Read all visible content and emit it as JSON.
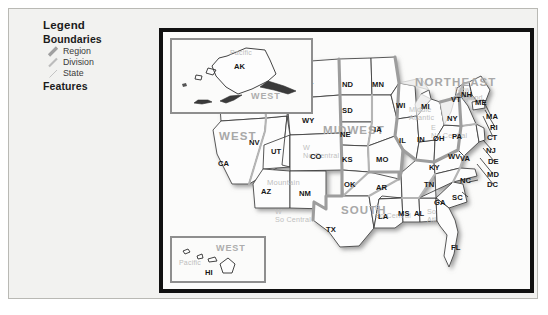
{
  "legend": {
    "title": "Legend",
    "boundaries_heading": "Boundaries",
    "features_heading": "Features",
    "items": [
      {
        "label": "Region",
        "swatch": "region-boundary-swatch",
        "color": "#a0a0a0",
        "width": 3.2
      },
      {
        "label": "Division",
        "swatch": "division-boundary-swatch",
        "color": "#bcbcbc",
        "width": 2.2
      },
      {
        "label": "State",
        "swatch": "state-boundary-swatch",
        "color": "#c8c8c8",
        "width": 1.0
      }
    ]
  },
  "map": {
    "title": "United States Census Regions and Divisions",
    "land_color": "#fdfdfd",
    "state_line_color": "#3a3a3a",
    "division_line_color": "#b5b5b5",
    "region_line_color": "#9d9d9d",
    "frame_color": "#111111",
    "regions": [
      {
        "name": "WEST",
        "x": 84,
        "y": 105
      },
      {
        "name": "MIDWEST",
        "x": 190,
        "y": 98
      },
      {
        "name": "SOUTH",
        "x": 205,
        "y": 178
      },
      {
        "name": "NORTHEAST",
        "x": 283,
        "y": 52
      }
    ],
    "divisions": [
      {
        "name": "Pacific",
        "x": 74,
        "y": 62
      },
      {
        "name": "Mountain",
        "x": 120,
        "y": 149
      },
      {
        "name": "W No Central",
        "line1": "W",
        "line2": "No Central",
        "x": 148,
        "y": 118
      },
      {
        "name": "E No Central",
        "line1": "E",
        "line2": "No Central",
        "x": 236,
        "y": 100
      },
      {
        "name": "W So Central",
        "line1": "W",
        "line2": "So Central",
        "x": 126,
        "y": 182
      },
      {
        "name": "E So Central",
        "line1": "E",
        "line2": "So Central",
        "x": 220,
        "y": 180
      },
      {
        "name": "So Atl",
        "line1": "So",
        "line2": "Atl",
        "x": 265,
        "y": 185
      },
      {
        "name": "New England",
        "line1": "New",
        "line2": "England",
        "x": 300,
        "y": 63
      },
      {
        "name": "Middle Atlantic",
        "line1": "Middle",
        "line2": "Atlantic",
        "x": 255,
        "y": 82
      }
    ],
    "states": [
      {
        "code": "WA",
        "x": 81,
        "y": 46
      },
      {
        "code": "OR",
        "x": 69,
        "y": 73
      },
      {
        "code": "CA",
        "x": 62,
        "y": 131
      },
      {
        "code": "NV",
        "x": 93,
        "y": 110
      },
      {
        "code": "ID",
        "x": 113,
        "y": 75
      },
      {
        "code": "MT",
        "x": 146,
        "y": 53
      },
      {
        "code": "WY",
        "x": 146,
        "y": 88
      },
      {
        "code": "UT",
        "x": 115,
        "y": 119
      },
      {
        "code": "CO",
        "x": 154,
        "y": 124
      },
      {
        "code": "AZ",
        "x": 105,
        "y": 159
      },
      {
        "code": "NM",
        "x": 143,
        "y": 161
      },
      {
        "code": "ND",
        "x": 186,
        "y": 52
      },
      {
        "code": "SD",
        "x": 186,
        "y": 78
      },
      {
        "code": "NE",
        "x": 184,
        "y": 102
      },
      {
        "code": "KS",
        "x": 186,
        "y": 127
      },
      {
        "code": "OK",
        "x": 188,
        "y": 152
      },
      {
        "code": "TX",
        "x": 170,
        "y": 197
      },
      {
        "code": "MN",
        "x": 216,
        "y": 52
      },
      {
        "code": "IA",
        "x": 218,
        "y": 97
      },
      {
        "code": "MO",
        "x": 220,
        "y": 127
      },
      {
        "code": "AR",
        "x": 220,
        "y": 155
      },
      {
        "code": "LA",
        "x": 222,
        "y": 184
      },
      {
        "code": "WI",
        "x": 240,
        "y": 73
      },
      {
        "code": "IL",
        "x": 243,
        "y": 108
      },
      {
        "code": "MS",
        "x": 242,
        "y": 181
      },
      {
        "code": "IN",
        "x": 261,
        "y": 107
      },
      {
        "code": "AL",
        "x": 258,
        "y": 181
      },
      {
        "code": "MI",
        "x": 265,
        "y": 74
      },
      {
        "code": "OH",
        "x": 277,
        "y": 106
      },
      {
        "code": "KY",
        "x": 273,
        "y": 135
      },
      {
        "code": "TN",
        "x": 268,
        "y": 152
      },
      {
        "code": "GA",
        "x": 278,
        "y": 170
      },
      {
        "code": "FL",
        "x": 295,
        "y": 215
      },
      {
        "code": "WV",
        "x": 292,
        "y": 124
      },
      {
        "code": "VA",
        "x": 304,
        "y": 126
      },
      {
        "code": "SC",
        "x": 296,
        "y": 165
      },
      {
        "code": "NC",
        "x": 304,
        "y": 148
      },
      {
        "code": "PA",
        "x": 296,
        "y": 104
      },
      {
        "code": "NY",
        "x": 291,
        "y": 86
      },
      {
        "code": "VT",
        "x": 295,
        "y": 67
      },
      {
        "code": "NH",
        "x": 305,
        "y": 62
      },
      {
        "code": "ME",
        "x": 319,
        "y": 70
      },
      {
        "code": "MA",
        "x": 330,
        "y": 84
      },
      {
        "code": "RI",
        "x": 334,
        "y": 95
      },
      {
        "code": "CT",
        "x": 331,
        "y": 105
      },
      {
        "code": "NJ",
        "x": 330,
        "y": 118
      },
      {
        "code": "DE",
        "x": 332,
        "y": 129
      },
      {
        "code": "MD",
        "x": 331,
        "y": 142
      },
      {
        "code": "DC",
        "x": 331,
        "y": 152
      }
    ]
  },
  "inset_alaska": {
    "name": "Alaska inset",
    "region_label": "WEST",
    "division_label": "Pacific",
    "state_label": "AK"
  },
  "inset_hawaii": {
    "name": "Hawaii inset",
    "region_label": "WEST",
    "division_label": "Pacific",
    "state_label": "HI"
  }
}
